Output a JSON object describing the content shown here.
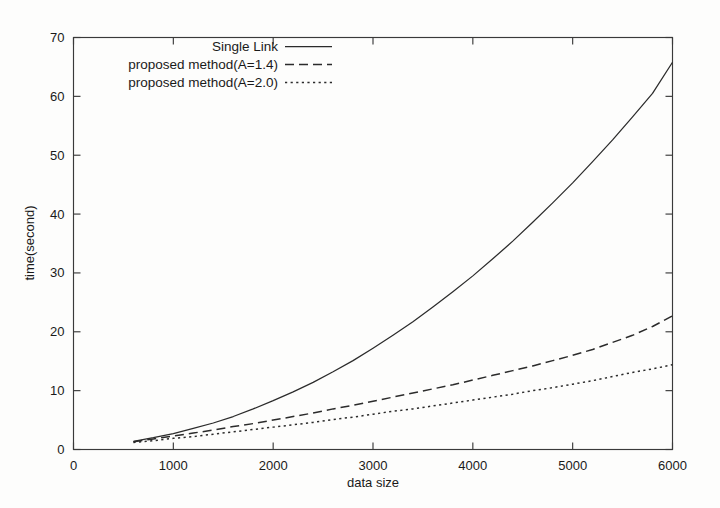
{
  "chart_data": {
    "type": "line",
    "title": "",
    "xlabel": "data size",
    "ylabel": "time(second)",
    "xlim": [
      0,
      6000
    ],
    "ylim": [
      0,
      70
    ],
    "xticks": [
      0,
      1000,
      2000,
      3000,
      4000,
      5000,
      6000
    ],
    "xtick_labels": [
      "0",
      "1000",
      "2000",
      "3000",
      "4000",
      "5000",
      "6000"
    ],
    "yticks": [
      0,
      10,
      20,
      30,
      40,
      50,
      60,
      70
    ],
    "ytick_labels": [
      "0",
      "10",
      "20",
      "30",
      "40",
      "50",
      "60",
      "70"
    ],
    "grid": false,
    "legend_position": "top-left",
    "x": [
      600,
      800,
      1000,
      1200,
      1400,
      1600,
      1800,
      2000,
      2200,
      2400,
      2600,
      2800,
      3000,
      3200,
      3400,
      3600,
      3800,
      4000,
      4200,
      4400,
      4600,
      4800,
      5000,
      5200,
      5400,
      5600,
      5800,
      6000
    ],
    "series": [
      {
        "name": "Single Link",
        "dash": "solid",
        "color": "#2b2b2b",
        "values": [
          1.4,
          2.0,
          2.7,
          3.6,
          4.5,
          5.6,
          6.9,
          8.3,
          9.8,
          11.4,
          13.2,
          15.1,
          17.2,
          19.4,
          21.7,
          24.2,
          26.8,
          29.5,
          32.4,
          35.4,
          38.6,
          41.9,
          45.3,
          48.9,
          52.6,
          56.5,
          60.5,
          65.8
        ]
      },
      {
        "name": "proposed method(A=1.4)",
        "dash": "dashed",
        "color": "#2b2b2b",
        "values": [
          1.3,
          1.8,
          2.3,
          2.8,
          3.3,
          3.9,
          4.4,
          5.0,
          5.6,
          6.2,
          6.9,
          7.5,
          8.2,
          8.9,
          9.6,
          10.3,
          11.0,
          11.8,
          12.6,
          13.4,
          14.2,
          15.1,
          16.0,
          17.0,
          18.2,
          19.4,
          20.9,
          22.7
        ]
      },
      {
        "name": "proposed method(A=2.0)",
        "dash": "dotted",
        "color": "#2b2b2b",
        "values": [
          1.2,
          1.5,
          1.9,
          2.2,
          2.6,
          3.0,
          3.4,
          3.8,
          4.2,
          4.6,
          5.1,
          5.5,
          6.0,
          6.5,
          6.9,
          7.4,
          7.9,
          8.4,
          8.9,
          9.4,
          10.0,
          10.5,
          11.1,
          11.7,
          12.4,
          13.1,
          13.7,
          14.4
        ]
      }
    ]
  },
  "axes": {
    "x_title": "data size",
    "y_title": "time(second)"
  },
  "legend": {
    "items": [
      {
        "label": "Single Link",
        "style": "solid"
      },
      {
        "label": "proposed method(A=1.4)",
        "style": "dashed"
      },
      {
        "label": "proposed method(A=2.0)",
        "style": "dotted"
      }
    ]
  },
  "colors": {
    "ink": "#2b2b2b",
    "frame": "#3a3a3a",
    "background": "#fdfdfc"
  }
}
